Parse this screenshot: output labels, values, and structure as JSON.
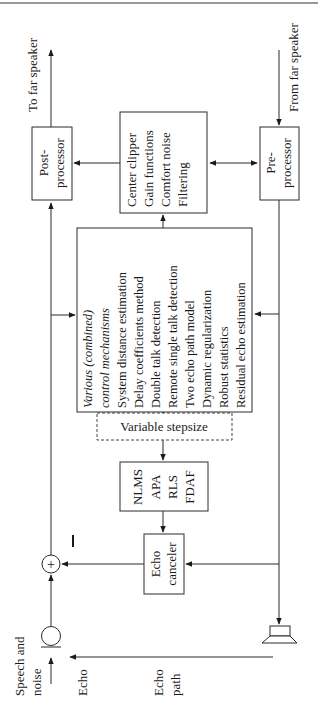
{
  "diagram": {
    "orientation": "rotated-90-ccw",
    "io_labels": {
      "to_far_speaker": "To far speaker",
      "from_far_speaker": "From far speaker",
      "speech_and_noise_line1": "Speech and",
      "speech_and_noise_line2": "noise",
      "echo": "Echo",
      "echo_path_line1": "Echo",
      "echo_path_line2": "path",
      "minus_sign": "–",
      "sum_symbol": "+"
    },
    "blocks": {
      "post_processor": {
        "line1": "Post-",
        "line2": "processor"
      },
      "pre_processor": {
        "line1": "Pre-",
        "line2": "processor"
      },
      "residual_processing": {
        "items": [
          "Center clipper",
          "Gain functions",
          "Comfort noise",
          "Filtering"
        ]
      },
      "control": {
        "heading1": "Various (combined)",
        "heading2": "control mechanisms",
        "items": [
          "System distance estimation",
          "Delay coefficients method",
          "Double talk detection",
          "Remote single talk detection",
          "Two echo path model",
          "Dynamic regularization",
          "Robust statistics",
          "Residual echo estimation"
        ]
      },
      "stepsize": {
        "label": "Variable stepsize"
      },
      "algorithms": {
        "items": [
          "NLMS",
          "APA",
          "RLS",
          "FDAF"
        ]
      },
      "echo_canceler": {
        "line1": "Echo",
        "line2": "canceler"
      }
    },
    "colors": {
      "line": "#2a2a2a",
      "text": "#1a1a1a",
      "background": "#ffffff"
    }
  }
}
